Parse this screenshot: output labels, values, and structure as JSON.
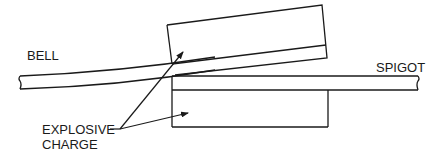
{
  "labels": {
    "bell": "BELL",
    "spigot": "SPIGOT",
    "explosive_line1": "EXPLOSIVE",
    "explosive_line2": "CHARGE"
  },
  "colors": {
    "stroke": "#1a1a1a",
    "background": "#ffffff"
  }
}
